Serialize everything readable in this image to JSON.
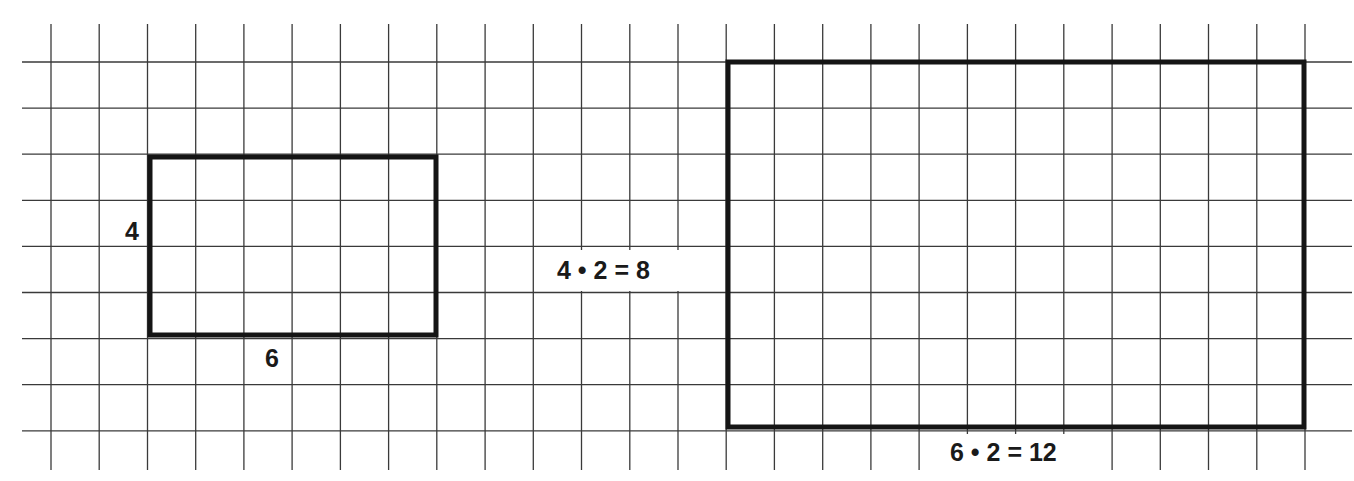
{
  "figure": {
    "colors": {
      "background": "#ffffff",
      "grid_line": "#3a3a3a",
      "shape_outline": "#151515",
      "text": "#1a1a1a"
    },
    "grid": {
      "vertical_line_count": 27,
      "horizontal_line_count": 9,
      "cell_width_px": 48.23,
      "cell_height_px": 46.1
    },
    "small_rectangle": {
      "width_units": 6,
      "height_units": 4,
      "height_label": "4",
      "width_label": "6"
    },
    "large_rectangle": {
      "width_units": 12,
      "height_units": 8,
      "height_label": "4 • 2 = 8",
      "width_label": "6 • 2 = 12"
    }
  }
}
